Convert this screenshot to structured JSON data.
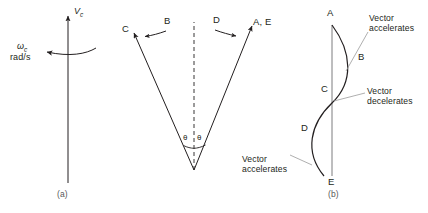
{
  "figure": {
    "background_color": "#ffffff",
    "stroke_color": "#231f20",
    "annotation_stroke_color": "#9a9a9a"
  },
  "panel_a": {
    "caption": "(a)",
    "velocity_label": "V",
    "velocity_subscript": "c",
    "omega_label": "ω",
    "omega_subscript": "c",
    "omega_units": "rad/s"
  },
  "panel_middle": {
    "left_ray_label": "C",
    "right_ray_label": "A, E",
    "left_arc_label": "B",
    "right_arc_label": "D",
    "angle_label_left": "θ",
    "angle_label_right": "θ"
  },
  "panel_b": {
    "caption": "(b)",
    "points": [
      {
        "name": "A",
        "label": "A"
      },
      {
        "name": "B",
        "label": "B"
      },
      {
        "name": "C",
        "label": "C"
      },
      {
        "name": "D",
        "label": "D"
      },
      {
        "name": "E",
        "label": "E"
      }
    ],
    "annotations": [
      {
        "name": "upper",
        "text": "Vector\naccelerates"
      },
      {
        "name": "middle",
        "text": "Vector\ndecelerates"
      },
      {
        "name": "lower",
        "text": "Vector\naccelerates"
      }
    ]
  }
}
